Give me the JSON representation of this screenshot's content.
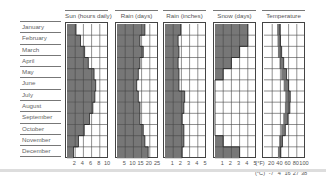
{
  "months": [
    "January",
    "February",
    "March",
    "April",
    "May",
    "June",
    "July",
    "August",
    "September",
    "October",
    "November",
    "December"
  ],
  "colors": {
    "fill": "#777777",
    "grid": "#444444",
    "label": "#555555"
  },
  "panels": [
    {
      "id": "sun",
      "title": "Sun (hours daily)",
      "ticks": [
        "2",
        "4",
        "6",
        "8",
        "10"
      ]
    },
    {
      "id": "rain_days",
      "title": "Rain (days)",
      "ticks": [
        "5",
        "10",
        "15",
        "20",
        "25"
      ]
    },
    {
      "id": "rain_inches",
      "title": "Rain (inches)",
      "ticks": [
        "1",
        "2",
        "3",
        "4",
        "5"
      ]
    },
    {
      "id": "snow",
      "title": "Snow (days)",
      "ticks": [
        "1",
        "2",
        "3",
        "4",
        "5"
      ],
      "unit_prefix": "(°F)"
    },
    {
      "id": "temp",
      "title": "Temperature",
      "ticks": [
        "20",
        "40",
        "60",
        "80",
        "100"
      ],
      "ticks_celsius": [
        "-7",
        "4",
        "16",
        "27",
        "38"
      ],
      "celsius_prefix": "(°C)"
    }
  ],
  "chart_data": [
    {
      "type": "bar",
      "title": "Sun (hours daily)",
      "orientation": "horizontal",
      "categories": [
        "January",
        "February",
        "March",
        "April",
        "May",
        "June",
        "July",
        "August",
        "September",
        "October",
        "November",
        "December"
      ],
      "values": [
        2.2,
        3.3,
        4.3,
        5.2,
        6.6,
        7.0,
        6.8,
        6.3,
        5.5,
        4.2,
        2.8,
        1.6
      ],
      "xlim": [
        0,
        10
      ],
      "xticks": [
        2,
        4,
        6,
        8,
        10
      ],
      "grid": true
    },
    {
      "type": "bar",
      "title": "Rain (days)",
      "orientation": "horizontal",
      "categories": [
        "January",
        "February",
        "March",
        "April",
        "May",
        "June",
        "July",
        "August",
        "September",
        "October",
        "November",
        "December"
      ],
      "values": [
        17,
        14,
        16,
        14,
        13,
        12,
        13,
        14,
        14,
        16,
        17,
        19
      ],
      "xlim": [
        0,
        25
      ],
      "xticks": [
        5,
        10,
        15,
        20,
        25
      ],
      "grid": true
    },
    {
      "type": "bar",
      "title": "Rain (inches)",
      "orientation": "horizontal",
      "categories": [
        "January",
        "February",
        "March",
        "April",
        "May",
        "June",
        "July",
        "August",
        "September",
        "October",
        "November",
        "December"
      ],
      "values": [
        1.9,
        1.6,
        1.7,
        1.6,
        1.7,
        1.7,
        2.4,
        2.3,
        2.1,
        2.3,
        2.3,
        2.1
      ],
      "xlim": [
        0,
        5
      ],
      "xticks": [
        1,
        2,
        3,
        4,
        5
      ],
      "grid": true
    },
    {
      "type": "bar",
      "title": "Snow (days)",
      "orientation": "horizontal",
      "categories": [
        "January",
        "February",
        "March",
        "April",
        "May",
        "June",
        "July",
        "August",
        "September",
        "October",
        "November",
        "December"
      ],
      "values": [
        4,
        4,
        3,
        2,
        1,
        0,
        0,
        0,
        0,
        0,
        1,
        3
      ],
      "xlim": [
        0,
        5
      ],
      "xticks": [
        1,
        2,
        3,
        4,
        5
      ],
      "grid": true
    },
    {
      "type": "area",
      "title": "Temperature",
      "orientation": "horizontal",
      "categories": [
        "January",
        "February",
        "March",
        "April",
        "May",
        "June",
        "July",
        "August",
        "September",
        "October",
        "November",
        "December"
      ],
      "series": [
        {
          "name": "min (°F)",
          "values": [
            32,
            33,
            34,
            38,
            42,
            48,
            52,
            51,
            47,
            42,
            37,
            34
          ]
        },
        {
          "name": "max (°F)",
          "values": [
            39,
            40,
            43,
            48,
            55,
            60,
            64,
            63,
            58,
            52,
            45,
            41
          ]
        }
      ],
      "xlim": [
        0,
        100
      ],
      "xticks_f": [
        20,
        40,
        60,
        80,
        100
      ],
      "xticks_c": [
        -7,
        4,
        16,
        27,
        38
      ],
      "grid": true
    }
  ]
}
